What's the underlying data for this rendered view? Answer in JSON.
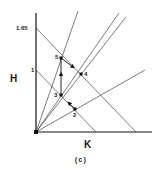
{
  "diagram": {
    "caption": "(c)",
    "axes": {
      "x_label": "K",
      "y_label": "H",
      "y_ticks": [
        {
          "label": "1.65"
        },
        {
          "label": "1"
        }
      ]
    },
    "points": [
      {
        "id": "2",
        "label": "2"
      },
      {
        "id": "3",
        "label": "3"
      },
      {
        "id": "4",
        "label": "4"
      },
      {
        "id": "5",
        "label": "5"
      }
    ],
    "path": [
      "2",
      "3",
      "5",
      "4"
    ],
    "colors": {
      "line": "#333333",
      "axis": "#111111",
      "background": "#ffffff"
    }
  }
}
